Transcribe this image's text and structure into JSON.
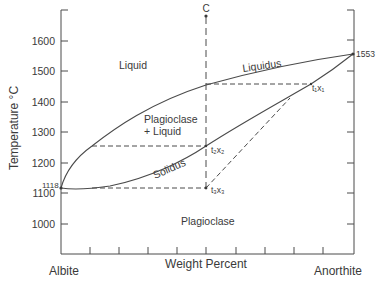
{
  "diagram": {
    "y_axis": {
      "label": "Temperature °C",
      "ticks": [
        "1600",
        "1500",
        "1400",
        "1300",
        "1200",
        "1100",
        "1000"
      ],
      "range": [
        900,
        1700
      ]
    },
    "x_axis": {
      "label": "Weight Percent",
      "left_endmember": "Albite",
      "right_endmember": "Anorthite",
      "tick_count": 9
    },
    "regions": {
      "liquid": "Liquid",
      "two_phase_line1": "Plagioclase",
      "two_phase_line2": "+ Liquid",
      "solid": "Plagioclase"
    },
    "curves": {
      "liquidus": "Liquidus",
      "solidus": "Solidus"
    },
    "points": {
      "albite_melt": "1118",
      "anorthite_melt": "1553",
      "composition": "C",
      "t1x1": "t₁x₁",
      "t2x2": "t₂x₂",
      "t3x3": "t₃x₃"
    },
    "colors": {
      "line": "#4a4a4a",
      "text": "#3a3a3a"
    }
  }
}
